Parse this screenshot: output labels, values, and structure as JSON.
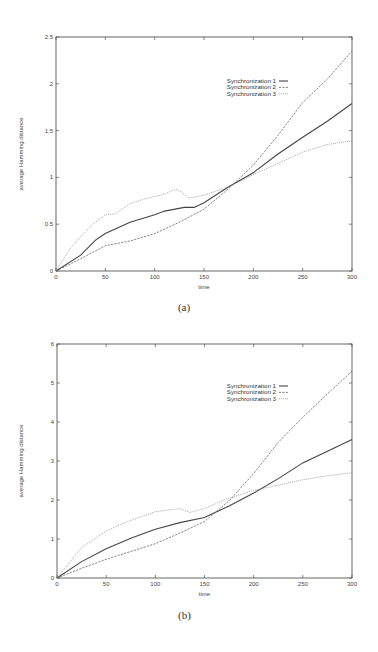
{
  "chart_data": [
    {
      "id": "a",
      "type": "line",
      "caption": "(a)",
      "title": "",
      "xlabel": "time",
      "ylabel": "average Hamming distance",
      "xlim": [
        0,
        300
      ],
      "ylim": [
        0,
        2.5
      ],
      "xticks": [
        0,
        50,
        100,
        150,
        200,
        250,
        300
      ],
      "xtick_labels": [
        "0",
        "50",
        "100",
        "150",
        "200",
        "250",
        "300"
      ],
      "yticks": [
        0,
        0.5,
        1,
        1.5,
        2,
        2.5
      ],
      "ytick_labels": [
        "0",
        "0.5",
        "1",
        "1.5",
        "2",
        "2.5"
      ],
      "grid": false,
      "legend_position": "upper right (inside)",
      "series": [
        {
          "name": "Synchronization 1",
          "style": "solid",
          "x": [
            0,
            25,
            40,
            50,
            75,
            100,
            110,
            130,
            140,
            150,
            175,
            200,
            225,
            250,
            275,
            300
          ],
          "values": [
            0,
            0.17,
            0.33,
            0.4,
            0.52,
            0.6,
            0.64,
            0.68,
            0.68,
            0.73,
            0.9,
            1.05,
            1.25,
            1.43,
            1.6,
            1.79
          ]
        },
        {
          "name": "Synchronization 2",
          "style": "dashed",
          "x": [
            0,
            25,
            50,
            75,
            100,
            125,
            150,
            175,
            200,
            225,
            250,
            275,
            300
          ],
          "values": [
            0,
            0.13,
            0.27,
            0.32,
            0.4,
            0.52,
            0.66,
            0.88,
            1.13,
            1.45,
            1.8,
            2.05,
            2.35
          ]
        },
        {
          "name": "Synchronization 3",
          "style": "dotted",
          "x": [
            0,
            15,
            35,
            50,
            60,
            75,
            90,
            110,
            120,
            125,
            135,
            150,
            170,
            185,
            200,
            225,
            250,
            275,
            300
          ],
          "values": [
            0,
            0.25,
            0.48,
            0.6,
            0.61,
            0.72,
            0.77,
            0.82,
            0.87,
            0.86,
            0.78,
            0.81,
            0.88,
            0.95,
            1.03,
            1.15,
            1.27,
            1.35,
            1.39
          ]
        }
      ]
    },
    {
      "id": "b",
      "type": "line",
      "caption": "(b)",
      "title": "",
      "xlabel": "time",
      "ylabel": "average Hamming distance",
      "xlim": [
        0,
        300
      ],
      "ylim": [
        0,
        6
      ],
      "xticks": [
        0,
        50,
        100,
        150,
        200,
        250,
        300
      ],
      "xtick_labels": [
        "0",
        "50",
        "100",
        "150",
        "200",
        "250",
        "300"
      ],
      "yticks": [
        0,
        1,
        2,
        3,
        4,
        5,
        6
      ],
      "ytick_labels": [
        "0",
        "1",
        "2",
        "3",
        "4",
        "5",
        "6"
      ],
      "grid": false,
      "legend_position": "upper right (inside)",
      "series": [
        {
          "name": "Synchronization 1",
          "style": "solid",
          "x": [
            0,
            25,
            50,
            75,
            100,
            125,
            150,
            175,
            200,
            225,
            250,
            275,
            300
          ],
          "values": [
            0,
            0.42,
            0.75,
            1.02,
            1.25,
            1.42,
            1.55,
            1.85,
            2.18,
            2.55,
            2.95,
            3.25,
            3.55
          ]
        },
        {
          "name": "Synchronization 2",
          "style": "dashed",
          "x": [
            0,
            25,
            50,
            75,
            100,
            125,
            150,
            175,
            200,
            225,
            250,
            275,
            300
          ],
          "values": [
            0,
            0.25,
            0.48,
            0.68,
            0.88,
            1.15,
            1.45,
            1.98,
            2.68,
            3.48,
            4.12,
            4.72,
            5.3
          ]
        },
        {
          "name": "Synchronization 3",
          "style": "dotted",
          "x": [
            0,
            25,
            50,
            65,
            80,
            100,
            115,
            125,
            135,
            150,
            170,
            200,
            225,
            250,
            275,
            300
          ],
          "values": [
            0,
            0.78,
            1.2,
            1.38,
            1.52,
            1.7,
            1.75,
            1.78,
            1.68,
            1.78,
            2.0,
            2.25,
            2.38,
            2.52,
            2.62,
            2.7
          ]
        }
      ]
    }
  ],
  "layout": [
    {
      "plot": {
        "x0": 56,
        "x1": 352,
        "y0": 271,
        "y1": 37
      },
      "legend": {
        "x": 276,
        "y": 81,
        "dy": 6.4
      },
      "xlabel_y": 289,
      "ylabel_x": 23,
      "caption_y": 311
    },
    {
      "plot": {
        "x0": 57,
        "x1": 352,
        "y0": 578,
        "y1": 344
      },
      "legend": {
        "x": 276,
        "y": 386,
        "dy": 6.4
      },
      "xlabel_y": 596,
      "ylabel_x": 23,
      "caption_y": 619
    }
  ]
}
